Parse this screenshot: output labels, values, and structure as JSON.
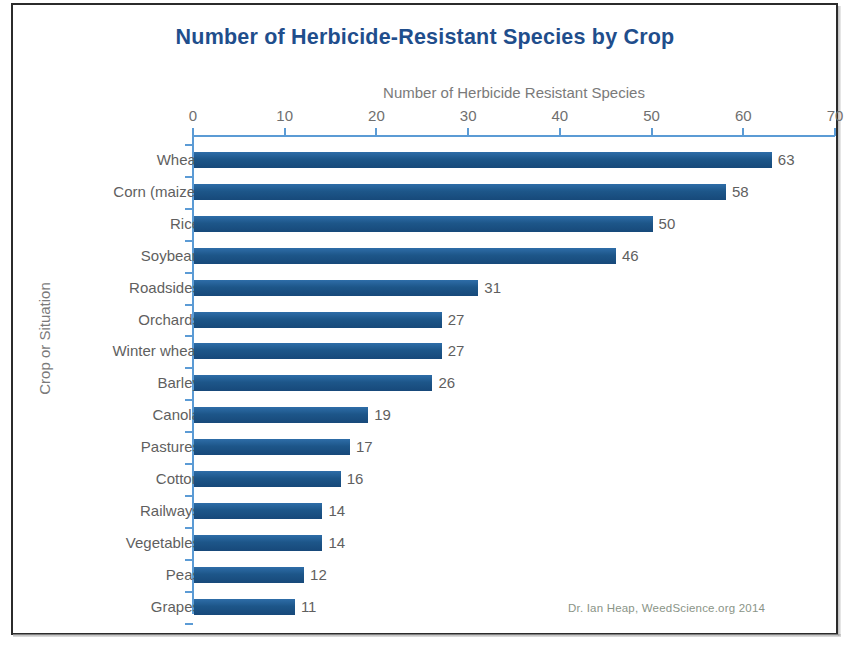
{
  "chart_data": {
    "type": "bar",
    "orientation": "horizontal",
    "title": "Number of Herbicide-Resistant Species by Crop",
    "xlabel": "Number of Herbicide Resistant Species",
    "ylabel": "Crop or Situation",
    "categories": [
      "Wheat",
      "Corn (maize)",
      "Rice",
      "Soybean",
      "Roadsides",
      "Orchards",
      "Winter wheat",
      "Barley",
      "Canola",
      "Pastures",
      "Cotton",
      "Railways",
      "Vegetables",
      "Peas",
      "Grapes"
    ],
    "values": [
      63,
      58,
      50,
      46,
      31,
      27,
      27,
      26,
      19,
      17,
      16,
      14,
      14,
      12,
      11
    ],
    "xlim": [
      0,
      70
    ],
    "xticks": [
      0,
      10,
      20,
      30,
      40,
      50,
      60,
      70
    ],
    "xtick_labels": [
      "0",
      "10",
      "20",
      "30",
      "40",
      "50",
      "60",
      "70"
    ],
    "grid": false,
    "legend": null,
    "data_labels": true,
    "series_color": "#1d5689",
    "title_color": "#1f4e8c",
    "axis_color": "#5b9bd5",
    "label_color": "#5f5f5f"
  },
  "credit": {
    "text": "Dr. Ian Heap, WeedScience.org 2014",
    "color": "#8a9487"
  }
}
